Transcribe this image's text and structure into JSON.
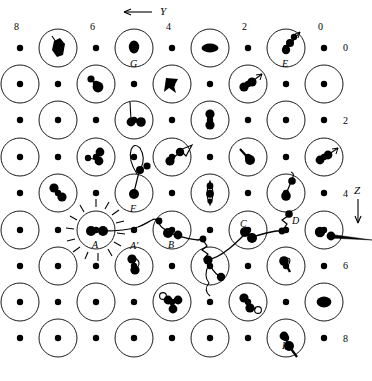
{
  "figure": {
    "type": "lattice-defect-diagram",
    "width": 372,
    "height": 381,
    "background_color": "#ffffff",
    "ink_color": "#000000"
  },
  "axes": {
    "horizontal": {
      "name": "Y",
      "label": "Y",
      "direction": "left",
      "arrow_x1": 152,
      "arrow_x2": 124,
      "arrow_y": 12,
      "label_x": 160,
      "label_y": 6,
      "ticks": [
        {
          "label": "8",
          "x": 14,
          "y": 22
        },
        {
          "label": "6",
          "x": 90,
          "y": 22
        },
        {
          "label": "4",
          "x": 166,
          "y": 22
        },
        {
          "label": "2",
          "x": 242,
          "y": 22
        },
        {
          "label": "0",
          "x": 318,
          "y": 22
        }
      ]
    },
    "vertical": {
      "name": "Z",
      "label": "Z",
      "direction": "down",
      "arrow_y1": 199,
      "arrow_y2": 223,
      "arrow_x": 358,
      "label_x": 354,
      "label_y": 185,
      "ticks": [
        {
          "label": "0",
          "x": 343,
          "y": 43
        },
        {
          "label": "2",
          "x": 343,
          "y": 116
        },
        {
          "label": "4",
          "x": 343,
          "y": 189
        },
        {
          "label": "6",
          "x": 343,
          "y": 261
        },
        {
          "label": "8",
          "x": 343,
          "y": 334
        }
      ]
    }
  },
  "lattice": {
    "circle_radius": 19,
    "dot_radius": 3.2,
    "column_spacing": 38,
    "row_spacing": 36.3,
    "rows": [
      {
        "y": 48,
        "circle_xs": [
          58,
          134,
          210,
          286
        ],
        "dot_xs": [
          20,
          96,
          172,
          248,
          324
        ]
      },
      {
        "y": 84,
        "circle_xs": [
          20,
          96,
          172,
          248,
          324
        ],
        "dot_xs": [
          58,
          134,
          210,
          286
        ]
      },
      {
        "y": 120,
        "circle_xs": [
          58,
          134,
          210,
          286
        ],
        "dot_xs": [
          20,
          96,
          172,
          248,
          324
        ]
      },
      {
        "y": 157,
        "circle_xs": [
          20,
          96,
          172,
          248,
          324
        ],
        "dot_xs": [
          58,
          134,
          210,
          286
        ]
      },
      {
        "y": 193,
        "circle_xs": [
          58,
          134,
          210,
          286
        ],
        "dot_xs": [
          20,
          96,
          172,
          248,
          324
        ]
      },
      {
        "y": 230,
        "circle_xs": [
          20,
          96,
          172,
          248,
          324
        ],
        "dot_xs": [
          58,
          134,
          210,
          286
        ]
      },
      {
        "y": 266,
        "circle_xs": [
          58,
          134,
          210,
          286
        ],
        "dot_xs": [
          20,
          96,
          172,
          248,
          324
        ]
      },
      {
        "y": 302,
        "circle_xs": [
          20,
          96,
          172,
          248,
          324
        ],
        "dot_xs": [
          58,
          134,
          210,
          286
        ]
      },
      {
        "y": 338,
        "circle_xs": [
          58,
          134,
          210,
          286
        ],
        "dot_xs": [
          20,
          96,
          172,
          248,
          324
        ]
      }
    ]
  },
  "site_labels": [
    {
      "name": "G",
      "text": "G",
      "x": 130,
      "y": 59
    },
    {
      "name": "E",
      "text": "E",
      "x": 282,
      "y": 59
    },
    {
      "name": "F",
      "text": "F",
      "x": 130,
      "y": 204
    },
    {
      "name": "A",
      "text": "A",
      "x": 92,
      "y": 240
    },
    {
      "name": "A'",
      "text": "A'",
      "x": 130,
      "y": 241
    },
    {
      "name": "B",
      "text": "B",
      "x": 168,
      "y": 240
    },
    {
      "name": "C",
      "text": "C",
      "x": 240,
      "y": 219
    },
    {
      "name": "D",
      "text": "D",
      "x": 292,
      "y": 216
    },
    {
      "name": "H",
      "text": "H",
      "x": 282,
      "y": 341
    }
  ],
  "defect_clusters": [
    {
      "site": "row1-c1",
      "cx": 58,
      "cy": 48,
      "kind": "displaced-pair-arrow"
    },
    {
      "site": "row1-G",
      "cx": 134,
      "cy": 48,
      "kind": "single-blob"
    },
    {
      "site": "row1-c3",
      "cx": 210,
      "cy": 48,
      "kind": "horizontal-pair"
    },
    {
      "site": "row1-E",
      "cx": 286,
      "cy": 48,
      "kind": "chain-with-arrow"
    },
    {
      "site": "row2-c2",
      "cx": 96,
      "cy": 84,
      "kind": "tilted-pair"
    },
    {
      "site": "row2-c3",
      "cx": 172,
      "cy": 84,
      "kind": "tripod"
    },
    {
      "site": "row2-c4",
      "cx": 248,
      "cy": 84,
      "kind": "pair-with-arrow"
    },
    {
      "site": "row3-c2",
      "cx": 134,
      "cy": 120,
      "kind": "stalk-pair"
    },
    {
      "site": "row3-c3",
      "cx": 210,
      "cy": 120,
      "kind": "vertical-pair"
    },
    {
      "site": "row4-c2",
      "cx": 96,
      "cy": 157,
      "kind": "triple-cluster"
    },
    {
      "site": "row4-c3",
      "cx": 172,
      "cy": 157,
      "kind": "pair-with-flag"
    },
    {
      "site": "row4-c4",
      "cx": 248,
      "cy": 157,
      "kind": "tilted-blob"
    },
    {
      "site": "row4-c5",
      "cx": 324,
      "cy": 157,
      "kind": "pair-with-arrow"
    },
    {
      "site": "row5-c1",
      "cx": 58,
      "cy": 193,
      "kind": "diagonal-pair"
    },
    {
      "site": "row5-F",
      "cx": 134,
      "cy": 193,
      "kind": "long-stalk"
    },
    {
      "site": "row5-c3",
      "cx": 210,
      "cy": 193,
      "kind": "lens-pair"
    },
    {
      "site": "row5-c4",
      "cx": 286,
      "cy": 193,
      "kind": "hook-pair"
    },
    {
      "site": "row6-A",
      "cx": 96,
      "cy": 230,
      "kind": "starburst-pair"
    },
    {
      "site": "row6-B",
      "cx": 172,
      "cy": 230,
      "kind": "track-pair"
    },
    {
      "site": "row6-C",
      "cx": 248,
      "cy": 230,
      "kind": "track-pair"
    },
    {
      "site": "row6-c5",
      "cx": 324,
      "cy": 230,
      "kind": "pair-with-spike"
    },
    {
      "site": "row7-c2",
      "cx": 134,
      "cy": 266,
      "kind": "vertical-chain"
    },
    {
      "site": "row7-c3",
      "cx": 210,
      "cy": 266,
      "kind": "dangling-chain"
    },
    {
      "site": "row7-c4",
      "cx": 286,
      "cy": 266,
      "kind": "hook-blob"
    },
    {
      "site": "row8-c3",
      "cx": 172,
      "cy": 302,
      "kind": "triple-ring"
    },
    {
      "site": "row8-c4",
      "cx": 248,
      "cy": 302,
      "kind": "pair-with-ring"
    },
    {
      "site": "row8-c5",
      "cx": 324,
      "cy": 302,
      "kind": "fat-blob"
    },
    {
      "site": "row9-H",
      "cx": 286,
      "cy": 338,
      "kind": "pair-with-tail"
    }
  ],
  "particle_track": {
    "name": "primary-knock-on-track",
    "description": "wiggly trajectory from A through A', B, C, D to the right edge",
    "stroke_width": 1.3
  }
}
